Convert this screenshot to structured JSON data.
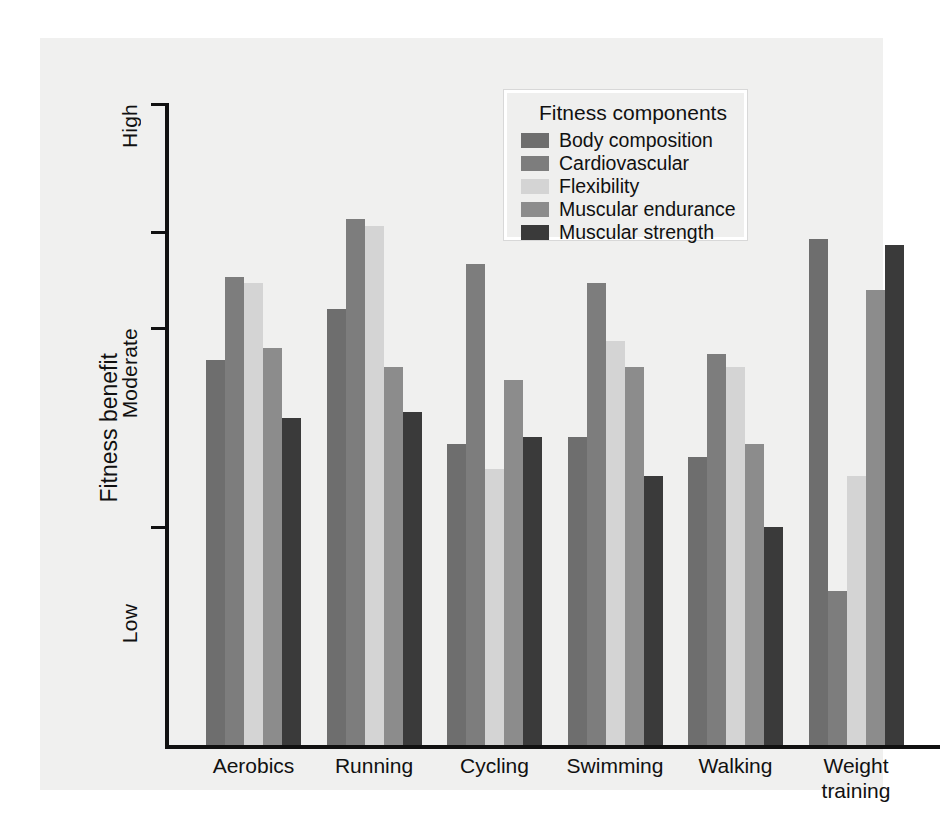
{
  "chart_data": {
    "type": "bar",
    "title": "",
    "xlabel": "",
    "ylabel": "Fitness benefit",
    "ylim": [
      0,
      100
    ],
    "grid": false,
    "legend_position": "top-center",
    "legend_title": "Fitness components",
    "ytick_labels": [
      "High",
      "Moderate",
      "Low"
    ],
    "categories": [
      "Aerobics",
      "Running",
      "Cycling",
      "Swimming",
      "Walking",
      "Weight\ntraining"
    ],
    "series": [
      {
        "name": "Body composition",
        "color": "#6e6e6e",
        "values": [
          60,
          68,
          47,
          48,
          45,
          79
        ]
      },
      {
        "name": "Cardiovascular",
        "color": "#7d7d7d",
        "values": [
          73,
          82,
          75,
          72,
          61,
          24
        ]
      },
      {
        "name": "Flexibility",
        "color": "#d4d4d4",
        "values": [
          72,
          81,
          43,
          63,
          59,
          42
        ]
      },
      {
        "name": "Muscular endurance",
        "color": "#8c8c8c",
        "values": [
          62,
          59,
          57,
          59,
          47,
          71
        ]
      },
      {
        "name": "Muscular strength",
        "color": "#3a3a3a",
        "values": [
          51,
          52,
          48,
          42,
          34,
          78
        ]
      }
    ]
  }
}
